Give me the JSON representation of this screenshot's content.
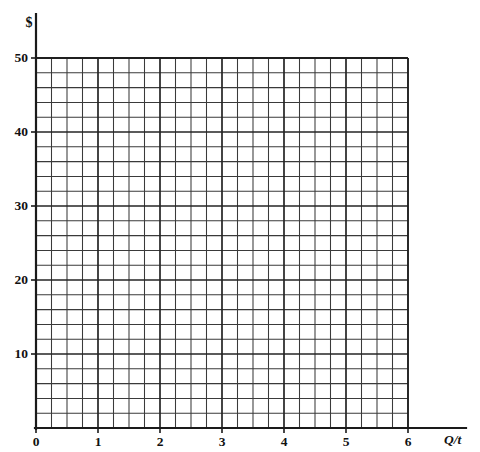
{
  "chart_data": {
    "type": "scatter",
    "title": "",
    "subtitle": "",
    "xlabel": "Q/t",
    "ylabel": "$",
    "xlim": [
      0,
      6
    ],
    "ylim": [
      0,
      50
    ],
    "x_ticks": [
      0,
      1,
      2,
      3,
      4,
      5,
      6
    ],
    "x_tick_labels": [
      "0",
      "1",
      "2",
      "3",
      "4",
      "5",
      "6"
    ],
    "y_ticks": [
      10,
      20,
      30,
      40,
      50
    ],
    "y_tick_labels": [
      "10",
      "20",
      "30",
      "40",
      "50"
    ],
    "grid": true,
    "grid_columns": 24,
    "grid_rows": 25,
    "grid_cell_x_units": 0.25,
    "grid_cell_y_units": 2,
    "major_grid_every_x": 4,
    "major_grid_every_y": 5,
    "legend": [],
    "series": [],
    "annotations": [],
    "colors": {
      "axis": "#1a1a1a",
      "grid_minor": "#3a3a3a",
      "grid_major": "#242424",
      "background": "#ffffff",
      "text": "#111111"
    }
  },
  "axes": {
    "y_axis_title": "$",
    "x_axis_title": "Q/t"
  }
}
